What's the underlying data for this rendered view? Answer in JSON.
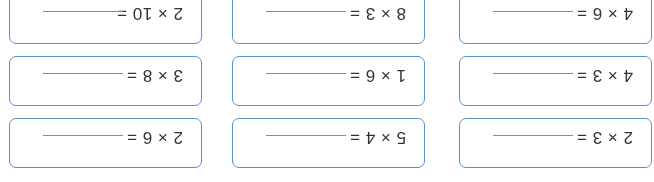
{
  "worksheet": {
    "orientation": "rotated-180",
    "border_color": "#5b8fc7",
    "problems": [
      {
        "expression": "2 × 3 =",
        "answer": ""
      },
      {
        "expression": "5 × 4 =",
        "answer": ""
      },
      {
        "expression": "2 × 6 =",
        "answer": ""
      },
      {
        "expression": "4 × 3 =",
        "answer": ""
      },
      {
        "expression": "1 × 6 =",
        "answer": ""
      },
      {
        "expression": "3 × 8 =",
        "answer": ""
      },
      {
        "expression": "4 × 6 =",
        "answer": ""
      },
      {
        "expression": "8 × 3 =",
        "answer": ""
      },
      {
        "expression": "2 × 10 =",
        "answer": ""
      }
    ]
  }
}
